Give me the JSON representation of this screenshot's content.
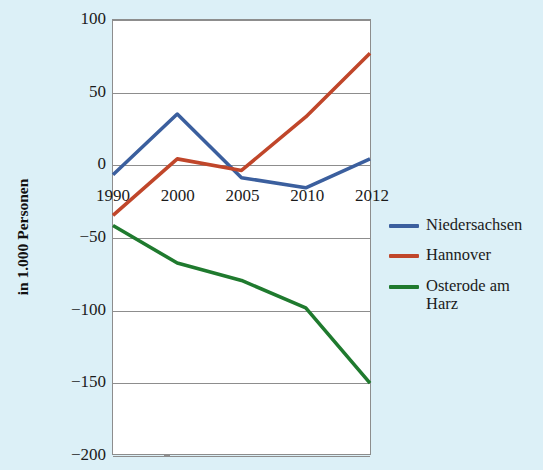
{
  "chart_data": {
    "type": "line",
    "title": "",
    "xlabel": "",
    "ylabel": "in 1.000 Personen",
    "categories": [
      "1990",
      "2000",
      "2005",
      "2010",
      "2012"
    ],
    "ylim": [
      -200,
      100
    ],
    "yticks": [
      100,
      50,
      0,
      -50,
      -100,
      -150,
      -200
    ],
    "ytick_labels": [
      "100",
      "50",
      "0",
      "−50",
      "−100",
      "−150",
      "−200"
    ],
    "grid": true,
    "legend_position": "right",
    "series": [
      {
        "name": "Niedersachsen",
        "color": "#3b5f9e",
        "values": [
          -7,
          35,
          -9,
          -16,
          4
        ]
      },
      {
        "name": "Hannover",
        "color": "#c0462a",
        "values": [
          -35,
          4,
          -4,
          33,
          77
        ]
      },
      {
        "name": "Osterode am Harz",
        "color": "#1f7a2e",
        "values": [
          -42,
          -68,
          -80,
          -99,
          -151
        ]
      }
    ]
  },
  "axis": {
    "y_title": "in 1.000 Personen"
  },
  "legend": {
    "items": [
      {
        "label": "Niedersachsen",
        "color": "#3b5f9e"
      },
      {
        "label": "Hannover",
        "color": "#c0462a"
      },
      {
        "label": "Osterode am Harz",
        "color": "#1f7a2e"
      }
    ]
  },
  "colors": {
    "background": "#dcf0f7",
    "plot_background": "#ffffff",
    "gridline": "#8d8d8d",
    "text": "#1b1b1b"
  }
}
